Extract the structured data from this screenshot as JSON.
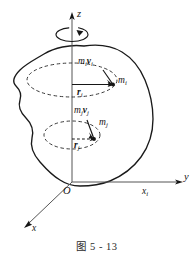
{
  "figure": {
    "caption": "图 5 - 13",
    "title_semantic": "rigid-body-rotating-about-z-axis",
    "axes": {
      "z_label": "z",
      "y_label": "y",
      "x_label": "x",
      "origin_label": "O",
      "xi_label": "x",
      "xi_sub": "i"
    },
    "particles": [
      {
        "mass_label": "m",
        "mass_sub": "i",
        "momentum_label": "m",
        "momentum_sub1": "i",
        "momentum_vec": "v",
        "momentum_sub2": "i",
        "radius_label": "r",
        "radius_sub": "i"
      },
      {
        "mass_label": "m",
        "mass_sub": "j",
        "momentum_label": "m",
        "momentum_sub1": "j",
        "momentum_vec": "v",
        "momentum_sub2": "j",
        "radius_label": "r",
        "radius_sub": "j"
      }
    ],
    "rotation": {
      "indicator": "rotation-arrow-about-z"
    },
    "colors": {
      "ink": "#161616",
      "body_outline": "#1a1a1a",
      "dashed": "#3a3a3a",
      "axis": "#555555",
      "caption": "#2b2b2b"
    }
  }
}
